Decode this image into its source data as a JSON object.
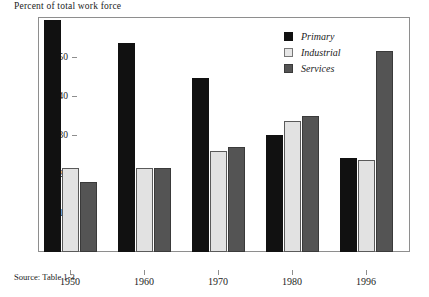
{
  "figure": {
    "title": "Percent of total work force",
    "source_note": "Source: Table 1-3."
  },
  "legend": {
    "position": "top-right",
    "items": [
      {
        "label": "Primary",
        "color": "#111111",
        "swatch": "primary"
      },
      {
        "label": "Industrial",
        "color": "#e2e2e2",
        "swatch": "industrial"
      },
      {
        "label": "Services",
        "color": "#545454",
        "swatch": "services"
      }
    ]
  },
  "axes": {
    "y_ticks": [
      "10",
      "20",
      "30",
      "40",
      "50"
    ],
    "x_ticks": [
      "1950",
      "1960",
      "1970",
      "1980",
      "1996"
    ]
  },
  "chart_data": {
    "type": "bar",
    "title": "Percent of total work force",
    "xlabel": "",
    "ylabel": "Percent of total work force",
    "categories": [
      "1950",
      "1960",
      "1970",
      "1980",
      "1996"
    ],
    "series": [
      {
        "name": "Primary",
        "color": "#111111",
        "values": [
          59.5,
          53.5,
          44.5,
          30.0,
          24.0
        ]
      },
      {
        "name": "Industrial",
        "color": "#e2e2e2",
        "values": [
          21.5,
          21.5,
          26.0,
          33.5,
          23.5
        ]
      },
      {
        "name": "Services",
        "color": "#545454",
        "values": [
          18.0,
          21.5,
          27.0,
          35.0,
          51.5
        ]
      }
    ],
    "ylim": [
      0,
      60
    ],
    "ytick_values": [
      10,
      20,
      30,
      40,
      50
    ],
    "grid": false,
    "legend": "top-right",
    "annotations": [
      "Source: Table 1-3."
    ]
  }
}
